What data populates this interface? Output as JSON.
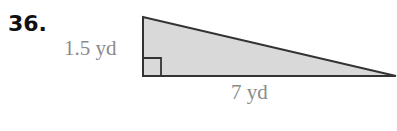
{
  "problem": {
    "number": "36."
  },
  "figure": {
    "shape": "right-triangle",
    "height_label": "1.5 yd",
    "base_label": "7 yd",
    "fill_color": "#d9d9d9",
    "stroke_color": "#333333",
    "label_color": "#8a8a8a"
  }
}
